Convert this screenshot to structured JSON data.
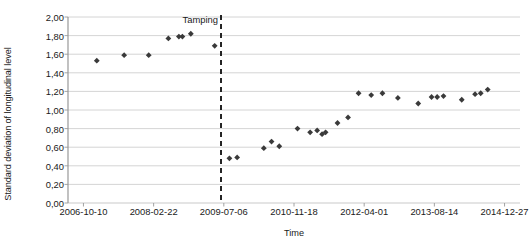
{
  "chart_data": {
    "type": "scatter",
    "title": "",
    "xlabel": "Time",
    "ylabel": "Standard deviation of longitudinal level",
    "ylim": [
      0.0,
      2.0
    ],
    "ytick_labels": [
      "0,00",
      "0,20",
      "0,40",
      "0,60",
      "0,80",
      "1,00",
      "1,20",
      "1,40",
      "1,60",
      "1,80",
      "2,00"
    ],
    "ytick_values": [
      0.0,
      0.2,
      0.4,
      0.6,
      0.8,
      1.0,
      1.2,
      1.4,
      1.6,
      1.8,
      2.0
    ],
    "xtick_labels": [
      "2006-10-10",
      "2008-02-22",
      "2009-07-06",
      "2010-11-18",
      "2012-04-01",
      "2013-08-14",
      "2014-12-27"
    ],
    "xtick_values": [
      0,
      1,
      2,
      3,
      4,
      5,
      6
    ],
    "xlim": [
      -0.22,
      6.22
    ],
    "grid": "horizontal",
    "legend": "none",
    "marker": "diamond",
    "marker_color": "#3a3a3a",
    "series": [
      {
        "name": "Standard deviation of longitudinal level",
        "points": [
          {
            "x": 0.19,
            "y": 1.53
          },
          {
            "x": 0.58,
            "y": 1.59
          },
          {
            "x": 0.93,
            "y": 1.59
          },
          {
            "x": 1.21,
            "y": 1.77
          },
          {
            "x": 1.36,
            "y": 1.79
          },
          {
            "x": 1.41,
            "y": 1.79
          },
          {
            "x": 1.53,
            "y": 1.82
          },
          {
            "x": 1.87,
            "y": 1.69
          },
          {
            "x": 2.08,
            "y": 0.48
          },
          {
            "x": 2.19,
            "y": 0.49
          },
          {
            "x": 2.57,
            "y": 0.59
          },
          {
            "x": 2.68,
            "y": 0.66
          },
          {
            "x": 2.79,
            "y": 0.61
          },
          {
            "x": 3.05,
            "y": 0.8
          },
          {
            "x": 3.23,
            "y": 0.76
          },
          {
            "x": 3.33,
            "y": 0.78
          },
          {
            "x": 3.4,
            "y": 0.74
          },
          {
            "x": 3.45,
            "y": 0.76
          },
          {
            "x": 3.62,
            "y": 0.86
          },
          {
            "x": 3.77,
            "y": 0.92
          },
          {
            "x": 3.92,
            "y": 1.18
          },
          {
            "x": 4.1,
            "y": 1.16
          },
          {
            "x": 4.26,
            "y": 1.18
          },
          {
            "x": 4.48,
            "y": 1.13
          },
          {
            "x": 4.77,
            "y": 1.07
          },
          {
            "x": 4.96,
            "y": 1.14
          },
          {
            "x": 5.04,
            "y": 1.14
          },
          {
            "x": 5.13,
            "y": 1.15
          },
          {
            "x": 5.39,
            "y": 1.11
          },
          {
            "x": 5.58,
            "y": 1.17
          },
          {
            "x": 5.66,
            "y": 1.18
          },
          {
            "x": 5.76,
            "y": 1.22
          }
        ]
      }
    ],
    "annotations": [
      {
        "name": "tamping",
        "label": "Tamping",
        "x": 1.96,
        "style": "dashed-vertical-line",
        "color": "#1a1a1a"
      }
    ]
  }
}
